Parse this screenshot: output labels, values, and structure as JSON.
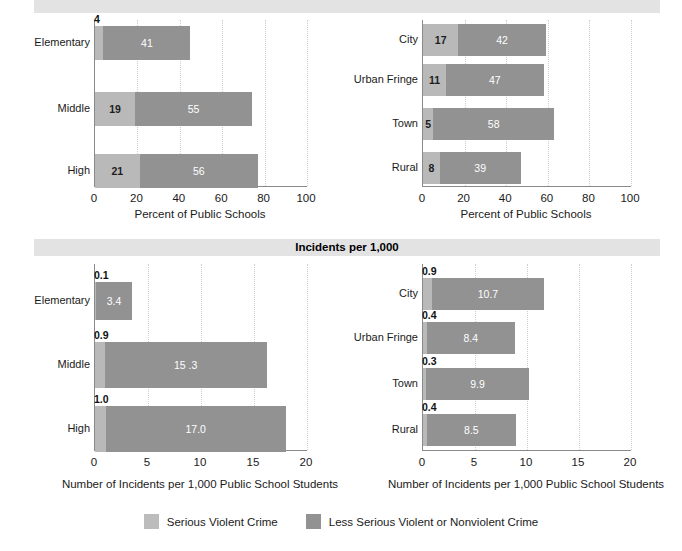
{
  "figure": {
    "bands": {
      "top_title": "",
      "mid_title": "Incidents per 1,000"
    },
    "legend": [
      {
        "label": "Serious Violent Crime",
        "color": "#bcbcbc",
        "key": "serious"
      },
      {
        "label": "Less Serious Violent or Nonviolent Crime",
        "color": "#929292",
        "key": "less_serious"
      }
    ]
  },
  "chart_data": [
    {
      "id": "percent-by-school-level",
      "type": "bar",
      "orientation": "horizontal",
      "stacked": true,
      "title": "",
      "xlabel": "Percent of Public Schools",
      "ylabel": "",
      "xlim": [
        0,
        100
      ],
      "xticks": [
        0,
        20,
        40,
        60,
        80,
        100
      ],
      "xtick_labels": [
        "0",
        "20",
        "40",
        "60",
        "80",
        "100"
      ],
      "grid": "vertical-dotted",
      "categories": [
        "Elementary",
        "Middle",
        "High"
      ],
      "series": [
        {
          "name": "Serious Violent Crime",
          "color": "#b9b9b9",
          "values": [
            4,
            19,
            21
          ],
          "value_labels": [
            "4",
            "19",
            "21"
          ],
          "label_position": [
            "outside",
            "inside",
            "inside"
          ]
        },
        {
          "name": "Less Serious Violent or Nonviolent Crime",
          "color": "#929292",
          "values": [
            41,
            55,
            56
          ],
          "value_labels": [
            "41",
            "55",
            "56"
          ],
          "label_position": [
            "inside",
            "inside",
            "inside"
          ]
        }
      ]
    },
    {
      "id": "percent-by-urbanicity",
      "type": "bar",
      "orientation": "horizontal",
      "stacked": true,
      "title": "",
      "xlabel": "Percent of Public Schools",
      "ylabel": "",
      "xlim": [
        0,
        100
      ],
      "xticks": [
        0,
        20,
        40,
        60,
        80,
        100
      ],
      "xtick_labels": [
        "0",
        "20",
        "40",
        "60",
        "80",
        "100"
      ],
      "grid": "vertical-dotted",
      "categories": [
        "City",
        "Urban Fringe",
        "Town",
        "Rural"
      ],
      "series": [
        {
          "name": "Serious Violent Crime",
          "color": "#b9b9b9",
          "values": [
            17,
            11,
            5,
            8
          ],
          "value_labels": [
            "17",
            "11",
            "5",
            "8"
          ],
          "label_position": [
            "inside",
            "inside",
            "inside",
            "inside"
          ]
        },
        {
          "name": "Less Serious Violent or Nonviolent Crime",
          "color": "#929292",
          "values": [
            42,
            47,
            58,
            39
          ],
          "value_labels": [
            "42",
            "47",
            "58",
            "39"
          ],
          "label_position": [
            "inside",
            "inside",
            "inside",
            "inside"
          ]
        }
      ]
    },
    {
      "id": "incidents-by-school-level",
      "type": "bar",
      "orientation": "horizontal",
      "stacked": true,
      "title": "Incidents per 1,000",
      "xlabel": "Number of Incidents per 1,000 Public School Students",
      "ylabel": "",
      "xlim": [
        0,
        20
      ],
      "xticks": [
        0,
        5,
        10,
        15,
        20
      ],
      "xtick_labels": [
        "0",
        "5",
        "10",
        "15",
        "20"
      ],
      "grid": "vertical-dotted",
      "categories": [
        "Elementary",
        "Middle",
        "High"
      ],
      "series": [
        {
          "name": "Serious Violent Crime",
          "color": "#b9b9b9",
          "values": [
            0.1,
            0.9,
            1.0
          ],
          "value_labels": [
            "0.1",
            "0.9",
            "1.0"
          ],
          "label_position": [
            "outside",
            "outside",
            "outside"
          ]
        },
        {
          "name": "Less Serious Violent or Nonviolent Crime",
          "color": "#929292",
          "values": [
            3.4,
            15.3,
            17.0
          ],
          "value_labels": [
            "3.4",
            "15 .3",
            "17.0"
          ],
          "label_position": [
            "inside",
            "inside",
            "inside"
          ]
        }
      ]
    },
    {
      "id": "incidents-by-urbanicity",
      "type": "bar",
      "orientation": "horizontal",
      "stacked": true,
      "title": "Incidents per 1,000",
      "xlabel": "Number of Incidents per 1,000 Public School Students",
      "ylabel": "",
      "xlim": [
        0,
        20
      ],
      "xticks": [
        0,
        5,
        10,
        15,
        20
      ],
      "xtick_labels": [
        "0",
        "5",
        "10",
        "15",
        "20"
      ],
      "grid": "vertical-dotted",
      "categories": [
        "City",
        "Urban Fringe",
        "Town",
        "Rural"
      ],
      "series": [
        {
          "name": "Serious Violent Crime",
          "color": "#b9b9b9",
          "values": [
            0.9,
            0.4,
            0.3,
            0.4
          ],
          "value_labels": [
            "0.9",
            "0.4",
            "0.3",
            "0.4"
          ],
          "label_position": [
            "outside",
            "outside",
            "outside",
            "outside"
          ]
        },
        {
          "name": "Less Serious Violent or Nonviolent Crime",
          "color": "#929292",
          "values": [
            10.7,
            8.4,
            9.9,
            8.5
          ],
          "value_labels": [
            "10.7",
            "8.4",
            "9.9",
            "8.5"
          ],
          "label_position": [
            "inside",
            "inside",
            "inside",
            "inside"
          ]
        }
      ]
    }
  ]
}
